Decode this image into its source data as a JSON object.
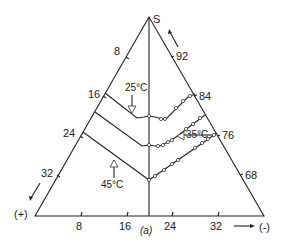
{
  "diagram": {
    "apex_label": "S",
    "left_label": "(+)",
    "right_label": "(-)",
    "caption": "(a)",
    "left_axis_ticks": [
      "8",
      "16",
      "24",
      "32"
    ],
    "right_axis_ticks": [
      "92",
      "84",
      "76",
      "68"
    ],
    "bottom_axis_ticks": [
      "8",
      "16",
      "24",
      "32"
    ],
    "isotherms": [
      {
        "label": "25°C"
      },
      {
        "label": "35°C"
      },
      {
        "label": "45°C"
      }
    ],
    "colors": {
      "line": "#222222",
      "background": "#ffffff"
    }
  }
}
